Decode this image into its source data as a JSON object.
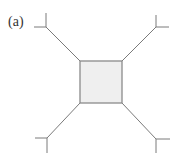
{
  "figure": {
    "label": "(a)",
    "colors": {
      "line": "#7a7a7a",
      "square_fill": "#efefef",
      "square_stroke": "#8a8a8a"
    },
    "square": {
      "x": 80,
      "y": 61,
      "w": 42,
      "h": 42
    },
    "branches": [
      {
        "name": "top-left",
        "corner": [
          80,
          61
        ],
        "junction": [
          46,
          27
        ],
        "stub_a": [
          46,
          13
        ],
        "stub_b": [
          34,
          27
        ]
      },
      {
        "name": "top-right",
        "corner": [
          122,
          61
        ],
        "junction": [
          156,
          27
        ],
        "stub_a": [
          156,
          15
        ],
        "stub_b": [
          169,
          27
        ]
      },
      {
        "name": "bottom-left",
        "corner": [
          80,
          103
        ],
        "junction": [
          47,
          138
        ],
        "stub_a": [
          47,
          153
        ],
        "stub_b": [
          35,
          138
        ]
      },
      {
        "name": "bottom-right",
        "corner": [
          122,
          103
        ],
        "junction": [
          156,
          139
        ],
        "stub_a": [
          156,
          153
        ],
        "stub_b": [
          170,
          139
        ]
      }
    ]
  }
}
